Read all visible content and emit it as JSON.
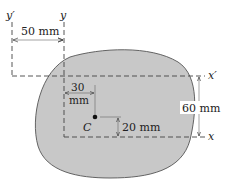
{
  "figure": {
    "colors": {
      "area_fill": "#c8c8c8",
      "area_stroke": "#555555",
      "line": "#444444",
      "text": "#222222"
    }
  },
  "axes": {
    "y_prime": "y′",
    "y": "y",
    "x_prime": "x′",
    "x": "x"
  },
  "centroid": {
    "label": "C"
  },
  "dimensions": {
    "y_prime_to_y": "50 mm",
    "y_to_centroid_line1": "30",
    "y_to_centroid_line2": "mm",
    "x_to_centroid": "20 mm",
    "x_to_x_prime": "60 mm"
  }
}
